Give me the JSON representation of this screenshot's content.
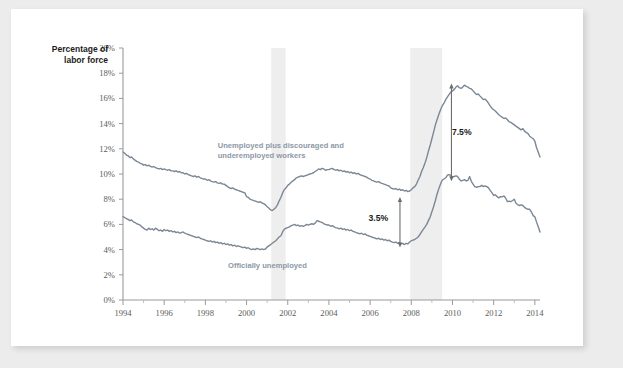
{
  "chart_data": {
    "type": "line",
    "title": "",
    "ylabel": "Percentage of labor force",
    "ylabel_line1": "Percentage of",
    "ylabel_line2": "labor force",
    "xlabel": "",
    "xlim": [
      1994,
      2014.25
    ],
    "ylim": [
      0,
      20
    ],
    "grid": false,
    "legend_position": "inline-annotation",
    "y_ticks": [
      0,
      2,
      4,
      6,
      8,
      10,
      12,
      14,
      16,
      18,
      20
    ],
    "y_tick_labels": [
      "0%",
      "2%",
      "4%",
      "6%",
      "8%",
      "10%",
      "12%",
      "14%",
      "16%",
      "18%",
      "20%"
    ],
    "x_ticks": [
      1994,
      1996,
      1998,
      2000,
      2002,
      2004,
      2006,
      2008,
      2010,
      2012,
      2014
    ],
    "x_tick_labels": [
      "1994",
      "1996",
      "1998",
      "2000",
      "2002",
      "2004",
      "2006",
      "2008",
      "2010",
      "2012",
      "2014"
    ],
    "x_minor_ticks": [
      1995,
      1997,
      1999,
      2001,
      2003,
      2005,
      2007,
      2009,
      2011,
      2013
    ],
    "line_color": "#7b8795",
    "shade_color": "#eeeeee",
    "series": [
      {
        "name": "Unemployed plus discouraged and underemployed workers",
        "label_line1": "Unemployed plus discouraged and",
        "label_line2": "underemployed workers",
        "color": "#7b8795",
        "x": [
          1994.0,
          1994.08,
          1994.17,
          1994.25,
          1994.33,
          1994.42,
          1994.5,
          1994.58,
          1994.67,
          1994.75,
          1994.83,
          1994.92,
          1995.0,
          1995.08,
          1995.17,
          1995.25,
          1995.33,
          1995.42,
          1995.5,
          1995.58,
          1995.67,
          1995.75,
          1995.83,
          1995.92,
          1996.0,
          1996.08,
          1996.17,
          1996.25,
          1996.33,
          1996.42,
          1996.5,
          1996.58,
          1996.67,
          1996.75,
          1996.83,
          1996.92,
          1997.0,
          1997.08,
          1997.17,
          1997.25,
          1997.33,
          1997.42,
          1997.5,
          1997.58,
          1997.67,
          1997.75,
          1997.83,
          1997.92,
          1998.0,
          1998.08,
          1998.17,
          1998.25,
          1998.33,
          1998.42,
          1998.5,
          1998.58,
          1998.67,
          1998.75,
          1998.83,
          1998.92,
          1999.0,
          1999.08,
          1999.17,
          1999.25,
          1999.33,
          1999.42,
          1999.5,
          1999.58,
          1999.67,
          1999.75,
          1999.83,
          1999.92,
          2000.0,
          2000.08,
          2000.17,
          2000.25,
          2000.33,
          2000.42,
          2000.5,
          2000.58,
          2000.67,
          2000.75,
          2000.83,
          2000.92,
          2001.0,
          2001.08,
          2001.17,
          2001.25,
          2001.33,
          2001.42,
          2001.5,
          2001.58,
          2001.67,
          2001.75,
          2001.83,
          2001.92,
          2002.0,
          2002.08,
          2002.17,
          2002.25,
          2002.33,
          2002.42,
          2002.5,
          2002.58,
          2002.67,
          2002.75,
          2002.83,
          2002.92,
          2003.0,
          2003.08,
          2003.17,
          2003.25,
          2003.33,
          2003.42,
          2003.5,
          2003.58,
          2003.67,
          2003.75,
          2003.83,
          2003.92,
          2004.0,
          2004.08,
          2004.17,
          2004.25,
          2004.33,
          2004.42,
          2004.5,
          2004.58,
          2004.67,
          2004.75,
          2004.83,
          2004.92,
          2005.0,
          2005.08,
          2005.17,
          2005.25,
          2005.33,
          2005.42,
          2005.5,
          2005.58,
          2005.67,
          2005.75,
          2005.83,
          2005.92,
          2006.0,
          2006.08,
          2006.17,
          2006.25,
          2006.33,
          2006.42,
          2006.5,
          2006.58,
          2006.67,
          2006.75,
          2006.83,
          2006.92,
          2007.0,
          2007.08,
          2007.17,
          2007.25,
          2007.33,
          2007.42,
          2007.5,
          2007.58,
          2007.67,
          2007.75,
          2007.83,
          2007.92,
          2008.0,
          2008.08,
          2008.17,
          2008.25,
          2008.33,
          2008.42,
          2008.5,
          2008.58,
          2008.67,
          2008.75,
          2008.83,
          2008.92,
          2009.0,
          2009.08,
          2009.17,
          2009.25,
          2009.33,
          2009.42,
          2009.5,
          2009.58,
          2009.67,
          2009.75,
          2009.83,
          2009.92,
          2010.0,
          2010.08,
          2010.17,
          2010.25,
          2010.33,
          2010.42,
          2010.5,
          2010.58,
          2010.67,
          2010.75,
          2010.83,
          2010.92,
          2011.0,
          2011.08,
          2011.17,
          2011.25,
          2011.33,
          2011.42,
          2011.5,
          2011.58,
          2011.67,
          2011.75,
          2011.83,
          2011.92,
          2012.0,
          2012.08,
          2012.17,
          2012.25,
          2012.33,
          2012.42,
          2012.5,
          2012.58,
          2012.67,
          2012.75,
          2012.83,
          2012.92,
          2013.0,
          2013.08,
          2013.17,
          2013.25,
          2013.33,
          2013.42,
          2013.5,
          2013.58,
          2013.67,
          2013.75,
          2013.83,
          2013.92,
          2014.0,
          2014.08,
          2014.17,
          2014.25
        ],
        "values": [
          11.75,
          11.65,
          11.5,
          11.45,
          11.3,
          11.35,
          11.2,
          11.1,
          11.0,
          10.95,
          10.85,
          10.8,
          10.7,
          10.75,
          10.65,
          10.7,
          10.6,
          10.55,
          10.6,
          10.5,
          10.45,
          10.4,
          10.45,
          10.35,
          10.4,
          10.35,
          10.3,
          10.35,
          10.25,
          10.25,
          10.2,
          10.25,
          10.15,
          10.2,
          10.1,
          10.1,
          10.0,
          10.05,
          9.95,
          9.9,
          9.85,
          9.8,
          9.85,
          9.75,
          9.8,
          9.7,
          9.65,
          9.6,
          9.6,
          9.5,
          9.55,
          9.45,
          9.4,
          9.35,
          9.4,
          9.3,
          9.25,
          9.3,
          9.2,
          9.2,
          9.1,
          9.0,
          8.9,
          8.85,
          8.9,
          8.8,
          8.75,
          8.7,
          8.65,
          8.6,
          8.55,
          8.5,
          8.2,
          8.15,
          8.0,
          7.95,
          7.9,
          7.85,
          7.8,
          7.75,
          7.8,
          7.7,
          7.65,
          7.55,
          7.4,
          7.3,
          7.15,
          7.1,
          7.2,
          7.35,
          7.55,
          7.85,
          8.15,
          8.5,
          8.75,
          8.9,
          9.1,
          9.2,
          9.35,
          9.45,
          9.55,
          9.7,
          9.75,
          9.8,
          9.85,
          9.8,
          9.85,
          9.9,
          9.95,
          10.0,
          10.05,
          10.1,
          10.2,
          10.3,
          10.4,
          10.35,
          10.45,
          10.4,
          10.3,
          10.35,
          10.35,
          10.4,
          10.45,
          10.35,
          10.3,
          10.35,
          10.25,
          10.3,
          10.2,
          10.25,
          10.15,
          10.2,
          10.1,
          10.15,
          10.05,
          10.1,
          10.0,
          10.05,
          9.95,
          9.9,
          9.85,
          9.8,
          9.75,
          9.65,
          9.6,
          9.5,
          9.45,
          9.4,
          9.35,
          9.4,
          9.3,
          9.25,
          9.2,
          9.15,
          9.1,
          9.05,
          8.9,
          8.85,
          8.8,
          8.85,
          8.75,
          8.8,
          8.7,
          8.75,
          8.65,
          8.7,
          8.6,
          8.65,
          8.75,
          8.9,
          9.0,
          9.2,
          9.5,
          9.8,
          10.2,
          10.5,
          10.9,
          11.3,
          11.8,
          12.3,
          12.8,
          13.3,
          13.9,
          14.3,
          14.7,
          15.1,
          15.4,
          15.6,
          15.9,
          16.1,
          16.3,
          16.5,
          16.6,
          16.7,
          16.9,
          17.0,
          16.85,
          16.8,
          16.9,
          17.05,
          16.95,
          16.9,
          16.8,
          16.75,
          16.6,
          16.45,
          16.3,
          16.35,
          16.2,
          16.05,
          15.9,
          15.95,
          15.8,
          15.6,
          15.4,
          15.2,
          15.1,
          15.0,
          14.85,
          14.7,
          14.6,
          14.5,
          14.4,
          14.45,
          14.3,
          14.15,
          14.1,
          14.0,
          13.9,
          13.8,
          13.7,
          13.6,
          13.5,
          13.6,
          13.4,
          13.3,
          13.2,
          13.0,
          12.9,
          12.8,
          12.6,
          12.1,
          11.7,
          11.35
        ]
      },
      {
        "name": "Officially unemployed",
        "label_line1": "Officially unemployed",
        "color": "#7b8795",
        "values": [
          6.6,
          6.55,
          6.45,
          6.4,
          6.3,
          6.35,
          6.2,
          6.15,
          6.05,
          6.0,
          5.95,
          5.8,
          5.7,
          5.6,
          5.55,
          5.7,
          5.6,
          5.65,
          5.55,
          5.7,
          5.6,
          5.5,
          5.55,
          5.45,
          5.6,
          5.5,
          5.55,
          5.45,
          5.5,
          5.4,
          5.45,
          5.35,
          5.4,
          5.3,
          5.35,
          5.4,
          5.3,
          5.25,
          5.2,
          5.15,
          5.1,
          5.05,
          5.0,
          4.95,
          5.0,
          4.9,
          4.85,
          4.8,
          4.75,
          4.7,
          4.65,
          4.7,
          4.6,
          4.65,
          4.55,
          4.6,
          4.5,
          4.55,
          4.45,
          4.5,
          4.4,
          4.45,
          4.35,
          4.4,
          4.3,
          4.35,
          4.25,
          4.3,
          4.25,
          4.2,
          4.15,
          4.2,
          4.1,
          4.15,
          4.05,
          4.0,
          4.05,
          4.0,
          4.1,
          4.05,
          4.0,
          4.05,
          4.0,
          4.05,
          4.2,
          4.3,
          4.4,
          4.5,
          4.6,
          4.7,
          4.85,
          5.0,
          5.1,
          5.4,
          5.6,
          5.7,
          5.75,
          5.8,
          5.9,
          5.95,
          6.0,
          5.9,
          5.95,
          5.85,
          5.9,
          5.85,
          5.9,
          6.0,
          5.95,
          6.0,
          6.05,
          6.0,
          6.1,
          6.3,
          6.25,
          6.2,
          6.15,
          6.05,
          6.0,
          5.95,
          5.95,
          5.85,
          5.9,
          5.8,
          5.75,
          5.7,
          5.65,
          5.7,
          5.6,
          5.65,
          5.55,
          5.6,
          5.5,
          5.55,
          5.45,
          5.4,
          5.35,
          5.3,
          5.25,
          5.3,
          5.2,
          5.25,
          5.15,
          5.1,
          5.05,
          5.0,
          4.95,
          4.9,
          4.85,
          4.9,
          4.8,
          4.85,
          4.75,
          4.8,
          4.7,
          4.75,
          4.65,
          4.6,
          4.55,
          4.6,
          4.5,
          4.55,
          4.45,
          4.5,
          4.4,
          4.5,
          4.45,
          4.6,
          4.7,
          4.75,
          4.8,
          4.9,
          5.0,
          5.2,
          5.4,
          5.6,
          5.8,
          6.0,
          6.3,
          6.6,
          7.0,
          7.4,
          7.9,
          8.4,
          8.8,
          9.2,
          9.5,
          9.6,
          9.7,
          9.9,
          9.95,
          9.9,
          9.75,
          9.8,
          9.85,
          9.8,
          9.6,
          9.45,
          9.5,
          9.55,
          9.45,
          9.5,
          9.8,
          9.4,
          9.2,
          9.0,
          8.95,
          9.0,
          9.0,
          9.1,
          9.0,
          9.05,
          9.0,
          8.9,
          8.7,
          8.5,
          8.3,
          8.35,
          8.2,
          8.1,
          8.2,
          8.2,
          8.25,
          8.1,
          7.8,
          7.85,
          7.8,
          7.9,
          8.0,
          7.7,
          7.55,
          7.5,
          7.55,
          7.5,
          7.35,
          7.25,
          7.2,
          7.2,
          7.0,
          6.7,
          6.6,
          6.2,
          5.8,
          5.4
        ]
      }
    ],
    "shaded_regions": [
      {
        "name": "recession-2001",
        "x_start": 2001.2,
        "x_end": 2001.9
      },
      {
        "name": "recession-2008",
        "x_start": 2007.95,
        "x_end": 2009.5
      }
    ],
    "annotations": [
      {
        "name": "gap-2007",
        "text": "3.5%",
        "x": 2007.45,
        "y_top": 8.0,
        "y_bottom": 4.35,
        "text_x": 2006.4,
        "text_y": 6.3
      },
      {
        "name": "gap-2010",
        "text": "7.5%",
        "x": 2009.95,
        "y_top": 17.0,
        "y_bottom": 9.6,
        "text_x": 2010.45,
        "text_y": 13.1
      }
    ]
  }
}
